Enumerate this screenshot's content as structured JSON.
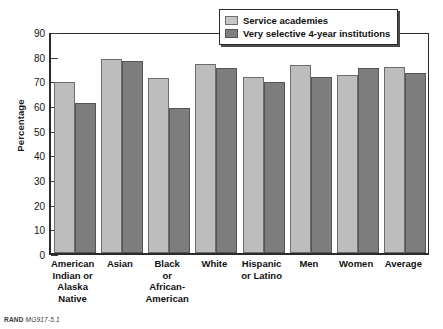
{
  "chart_data": {
    "type": "bar",
    "title": "",
    "xlabel": "",
    "ylabel": "Percentage",
    "ylim": [
      0,
      90
    ],
    "ytick_step": 10,
    "yticks": [
      0,
      10,
      20,
      30,
      40,
      50,
      60,
      70,
      80,
      90
    ],
    "grid": false,
    "legend_position": "top-right",
    "categories": [
      "American Indian or Alaska Native",
      "Asian",
      "Black or African-American",
      "White",
      "Hispanic or Latino",
      "Men",
      "Women",
      "Average"
    ],
    "category_label_lines": [
      [
        "American",
        "Indian or",
        "Alaska",
        "Native"
      ],
      [
        "Asian"
      ],
      [
        "Black",
        "or",
        "African-",
        "American"
      ],
      [
        "White"
      ],
      [
        "Hispanic",
        "or Latino"
      ],
      [
        "Men"
      ],
      [
        "Women"
      ],
      [
        "Average"
      ]
    ],
    "series": [
      {
        "name": "Service academies",
        "color": "#bdbdbd",
        "values": [
          70,
          79.5,
          71.5,
          77.5,
          72,
          77,
          73,
          76
        ]
      },
      {
        "name": "Very selective 4-year institutions",
        "color": "#7d7d7d",
        "values": [
          61.5,
          78.5,
          59.5,
          75.5,
          70,
          72,
          75.5,
          73.5
        ]
      }
    ]
  },
  "legend": {
    "items": [
      {
        "label": "Service academies",
        "swatch": "light"
      },
      {
        "label": "Very selective 4-year institutions",
        "swatch": "dark"
      }
    ]
  },
  "credit": {
    "source": "RAND",
    "figure_number": "MG917-5.1"
  }
}
